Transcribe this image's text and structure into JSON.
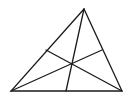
{
  "diagram": {
    "type": "triangle-with-cevians",
    "stroke_color": "#1a1a1a",
    "background": "#ffffff",
    "vertices": {
      "A": [
        84,
        9
      ],
      "B": [
        11,
        91
      ],
      "C": [
        122,
        91
      ]
    },
    "side_points": {
      "on_AB": [
        46,
        50
      ],
      "on_AC": [
        102,
        50
      ],
      "on_BC": [
        66,
        91
      ]
    },
    "concurrency_point": [
      72,
      64
    ],
    "cevians": [
      {
        "from": "A",
        "to": "on_BC"
      },
      {
        "from": "B",
        "to": "on_AC"
      },
      {
        "from": "C",
        "to": "on_AB"
      }
    ]
  }
}
